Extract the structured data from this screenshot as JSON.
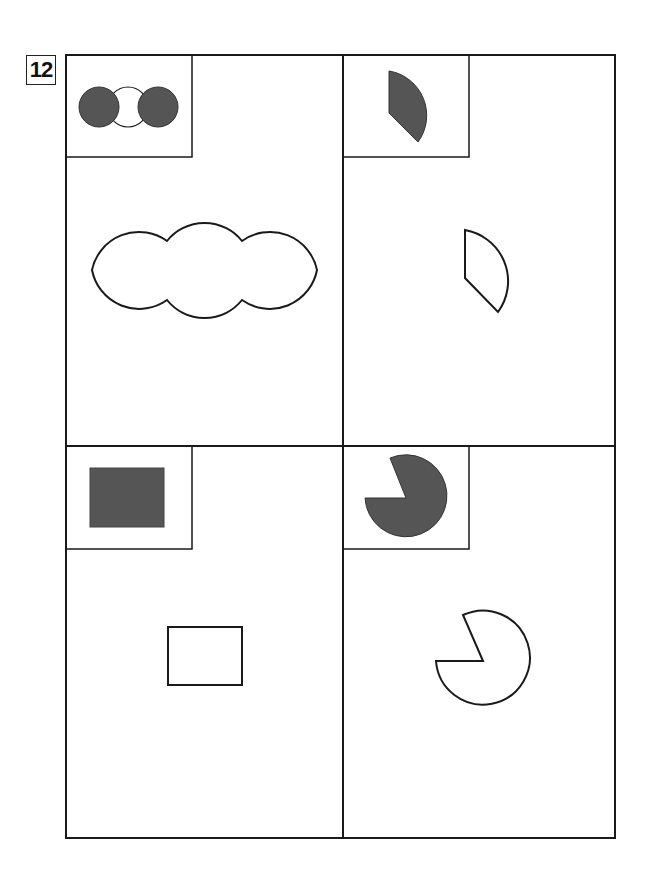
{
  "problem_number": "12",
  "colors": {
    "stroke": "#1a1a1a",
    "fill_dark": "#555555",
    "background": "#ffffff"
  },
  "panels": [
    {
      "position": "top-left",
      "example": "three overlapping circles, outer two shaded",
      "target": "three overlapping circles outline"
    },
    {
      "position": "top-right",
      "example": "shaded quarter sector",
      "target": "outlined quarter sector"
    },
    {
      "position": "bottom-left",
      "example": "shaded rectangle",
      "target": "outlined rectangle"
    },
    {
      "position": "bottom-right",
      "example": "shaded circle with wedge removed",
      "target": "outlined circle with wedge removed"
    }
  ]
}
